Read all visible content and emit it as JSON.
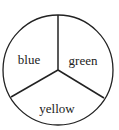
{
  "diagram": {
    "type": "spinner",
    "colors": {
      "stroke": "#222222",
      "background": "#ffffff",
      "text": "#222222"
    },
    "circle": {
      "cx": 58,
      "cy": 70,
      "r": 55
    },
    "sectors": [
      {
        "label": "blue",
        "x": 29,
        "y": 64
      },
      {
        "label": "green",
        "x": 83,
        "y": 65
      },
      {
        "label": "yellow",
        "x": 57,
        "y": 113
      }
    ],
    "dividers": [
      {
        "x2": 58,
        "y2": 15
      },
      {
        "x2": 11,
        "y2": 97
      },
      {
        "x2": 104,
        "y2": 98
      }
    ]
  }
}
